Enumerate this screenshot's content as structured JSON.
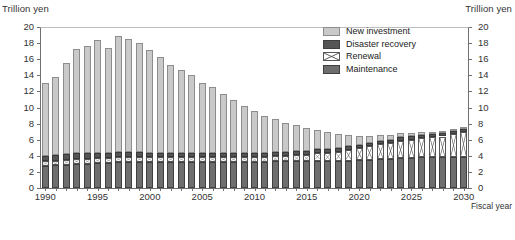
{
  "axis_titles": {
    "left": "Trillion yen",
    "right": "Trillion yen"
  },
  "xaxis_caption": "Fiscal year",
  "legend": {
    "items": [
      {
        "label": "New investment",
        "key": "new_investment",
        "color": "#c9c9c9",
        "pattern": "solid"
      },
      {
        "label": "Disaster recovery",
        "key": "disaster_recovery",
        "color": "#555555",
        "pattern": "solid"
      },
      {
        "label": "Renewal",
        "key": "renewal",
        "color": "#ffffff",
        "pattern": "cross-hatch"
      },
      {
        "label": "Maintenance",
        "key": "maintenance",
        "color": "#6e6e6e",
        "pattern": "solid"
      }
    ]
  },
  "chart_data": {
    "type": "bar",
    "title": "",
    "subtitle": "",
    "xlabel": "Fiscal year",
    "ylabel": "Trillion yen",
    "ylim": [
      0,
      20
    ],
    "ytick_step": 2,
    "yticks": [
      "0",
      "2",
      "4",
      "6",
      "8",
      "10",
      "12",
      "14",
      "16",
      "18",
      "20"
    ],
    "xtick_labels": [
      "1990",
      "1995",
      "2000",
      "2005",
      "2010",
      "2015",
      "2020",
      "2025",
      "2030"
    ],
    "grid": false,
    "stacked": true,
    "legend_position": "top-right-inside",
    "dual_axis": true,
    "right_ylim": [
      0,
      20
    ],
    "categories": [
      "1990",
      "1991",
      "1992",
      "1993",
      "1994",
      "1995",
      "1996",
      "1997",
      "1998",
      "1999",
      "2000",
      "2001",
      "2002",
      "2003",
      "2004",
      "2005",
      "2006",
      "2007",
      "2008",
      "2009",
      "2010",
      "2011",
      "2012",
      "2013",
      "2014",
      "2015",
      "2016",
      "2017",
      "2018",
      "2019",
      "2020",
      "2021",
      "2022",
      "2023",
      "2024",
      "2025",
      "2026",
      "2027",
      "2028",
      "2029",
      "2030"
    ],
    "stack_order_bottom_to_top": [
      "maintenance",
      "renewal",
      "disaster_recovery",
      "new_investment"
    ],
    "series": [
      {
        "name": "Maintenance",
        "values": [
          2.7,
          2.8,
          2.9,
          3.0,
          3.0,
          3.1,
          3.1,
          3.2,
          3.2,
          3.2,
          3.2,
          3.2,
          3.2,
          3.2,
          3.2,
          3.2,
          3.2,
          3.2,
          3.2,
          3.2,
          3.2,
          3.2,
          3.3,
          3.3,
          3.3,
          3.3,
          3.4,
          3.4,
          3.4,
          3.4,
          3.5,
          3.5,
          3.6,
          3.6,
          3.7,
          3.7,
          3.8,
          3.8,
          3.8,
          3.9,
          3.9
        ]
      },
      {
        "name": "Renewal",
        "values": [
          0.6,
          0.6,
          0.6,
          0.6,
          0.6,
          0.6,
          0.6,
          0.6,
          0.6,
          0.6,
          0.6,
          0.6,
          0.6,
          0.6,
          0.6,
          0.6,
          0.6,
          0.6,
          0.6,
          0.6,
          0.7,
          0.7,
          0.7,
          0.7,
          0.8,
          0.8,
          0.9,
          1.0,
          1.1,
          1.3,
          1.5,
          1.7,
          1.9,
          2.0,
          2.2,
          2.3,
          2.4,
          2.5,
          2.6,
          2.8,
          3.0
        ]
      },
      {
        "name": "Disaster recovery",
        "values": [
          0.7,
          0.7,
          0.7,
          0.7,
          0.7,
          0.7,
          0.7,
          0.7,
          0.7,
          0.7,
          0.6,
          0.6,
          0.6,
          0.6,
          0.6,
          0.6,
          0.6,
          0.6,
          0.6,
          0.6,
          0.5,
          0.5,
          0.5,
          0.5,
          0.5,
          0.5,
          0.5,
          0.5,
          0.5,
          0.5,
          0.4,
          0.4,
          0.4,
          0.4,
          0.4,
          0.4,
          0.4,
          0.4,
          0.4,
          0.4,
          0.4
        ]
      },
      {
        "name": "New investment",
        "values": [
          9.1,
          9.7,
          11.3,
          13.0,
          13.3,
          14.0,
          13.0,
          14.4,
          14.0,
          13.5,
          12.7,
          11.9,
          10.9,
          10.2,
          9.7,
          8.7,
          8.1,
          7.3,
          6.5,
          5.8,
          5.2,
          4.6,
          4.1,
          3.6,
          3.2,
          2.8,
          2.4,
          2.0,
          1.7,
          1.4,
          1.1,
          0.9,
          0.7,
          0.6,
          0.5,
          0.4,
          0.4,
          0.3,
          0.3,
          0.2,
          0.2
        ]
      }
    ],
    "totals": [
      13.1,
      13.8,
      15.5,
      17.3,
      17.6,
      18.4,
      17.4,
      18.9,
      18.5,
      18.0,
      17.1,
      16.3,
      15.3,
      14.6,
      14.1,
      13.1,
      12.4,
      11.6,
      10.8,
      10.1,
      9.6,
      9.0,
      8.6,
      8.1,
      7.8,
      7.4,
      7.2,
      6.9,
      6.7,
      6.6,
      6.5,
      6.5,
      6.6,
      6.6,
      6.8,
      6.8,
      7.0,
      7.0,
      7.1,
      7.3,
      7.5
    ]
  }
}
